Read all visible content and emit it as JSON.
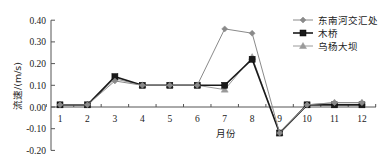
{
  "chart_data": {
    "type": "line",
    "title": "",
    "xlabel": "月份",
    "ylabel": "流速/(m/s)",
    "x": [
      1,
      2,
      3,
      4,
      5,
      6,
      7,
      8,
      9,
      10,
      11,
      12
    ],
    "categories": [
      "1",
      "2",
      "3",
      "4",
      "5",
      "6",
      "7",
      "8",
      "9",
      "10",
      "11",
      "12"
    ],
    "ylim": [
      -0.2,
      0.4
    ],
    "yticks": [
      "0.40",
      "0.30",
      "0.20",
      "0.10",
      "0.00",
      "-0.10",
      "-0.20"
    ],
    "ytick_values": [
      0.4,
      0.3,
      0.2,
      0.1,
      0.0,
      -0.1,
      -0.2
    ],
    "grid": false,
    "legend_position": "upper right",
    "series": [
      {
        "name": "东南河交汇处",
        "marker": "diamond",
        "color": "#8a8a8a",
        "values": [
          0.01,
          0.01,
          0.12,
          0.1,
          0.1,
          0.1,
          0.36,
          0.34,
          -0.12,
          0.01,
          0.02,
          0.02
        ]
      },
      {
        "name": "木桥",
        "marker": "square",
        "color": "#1a1a1a",
        "values": [
          0.01,
          0.01,
          0.14,
          0.1,
          0.1,
          0.1,
          0.1,
          0.22,
          -0.12,
          0.01,
          0.01,
          0.01
        ]
      },
      {
        "name": "乌杨大坝",
        "marker": "triangle",
        "color": "#9a9a9a",
        "values": [
          0.01,
          0.01,
          0.13,
          0.1,
          0.1,
          0.1,
          0.08,
          0.23,
          -0.12,
          0.01,
          0.02,
          0.02
        ]
      }
    ]
  }
}
